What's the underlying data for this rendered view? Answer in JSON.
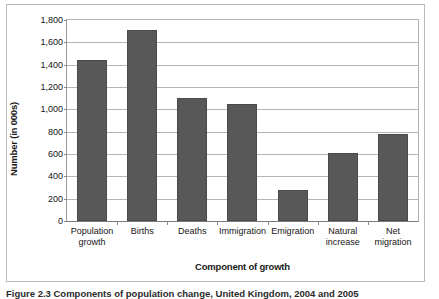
{
  "figure": {
    "caption": "Figure 2.3  Components of population change, United Kingdom, 2004 and 2005"
  },
  "chart_data": {
    "type": "bar",
    "title": "",
    "xlabel": "Component of growth",
    "ylabel": "Number (in 000s)",
    "categories": [
      "Population\ngrowth",
      "Births",
      "Deaths",
      "Immigration",
      "Emigration",
      "Natural\nincrease",
      "Net\nmigration"
    ],
    "values": [
      1440,
      1710,
      1100,
      1050,
      275,
      610,
      775
    ],
    "ylim": [
      0,
      1800
    ],
    "ytick_step": 200,
    "ytick_labels": [
      "0",
      "200",
      "400",
      "600",
      "800",
      "1,000",
      "1,200",
      "1,400",
      "1,600",
      "1,800"
    ],
    "grid": true,
    "legend": "none",
    "bar_color": "#585858",
    "gridline_color": "#b5b5b5",
    "axis_color": "#7c7c7c"
  }
}
